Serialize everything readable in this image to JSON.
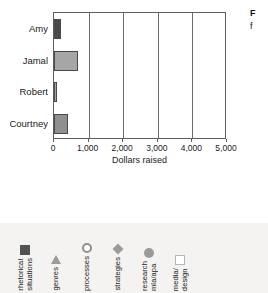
{
  "chart_data": {
    "type": "bar",
    "orientation": "horizontal",
    "title": "",
    "categories": [
      "Amy",
      "Jamal",
      "Robert",
      "Courtney"
    ],
    "values": [
      200,
      700,
      100,
      400
    ],
    "xlabel": "Dollars raised",
    "ylabel": "",
    "xlim": [
      0,
      5000
    ],
    "xticks": [
      0,
      1000,
      2000,
      3000,
      4000,
      5000
    ],
    "xtick_labels": [
      "0",
      "1,000",
      "2,000",
      "3,000",
      "4,000",
      "5,000"
    ],
    "grid": "vertical",
    "legend_position": "below",
    "bar_colors": [
      "#4a4a4a",
      "#a6a6a6",
      "#a6a6a6",
      "#8f8f8f"
    ]
  },
  "caption_fragment": {
    "line1": "F",
    "line2": "f"
  },
  "legend": {
    "items": [
      {
        "label": "rhetorical\nsituations",
        "marker": "square-filled-icon",
        "color": "#535353"
      },
      {
        "label": "genres",
        "marker": "triangle-icon",
        "color": "#9b9b9b"
      },
      {
        "label": "processes",
        "marker": "circle-open-icon",
        "color": "#8f8f8f"
      },
      {
        "label": "strategies",
        "marker": "diamond-icon",
        "color": "#9b9b9b"
      },
      {
        "label": "research\nmla/apa",
        "marker": "circle-filled-icon",
        "color": "#9b9b9b"
      },
      {
        "label": "media/\ndesign",
        "marker": "square-open-icon",
        "color": "#b5b5b5"
      }
    ]
  }
}
